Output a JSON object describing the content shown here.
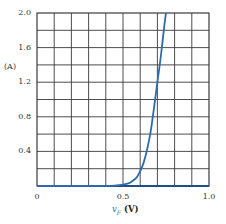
{
  "chart_data": {
    "type": "line",
    "title": "",
    "xlabel": "v_F (V)",
    "xlabel_var": "v",
    "xlabel_sub": "F",
    "xlabel_unit": "(V)",
    "ylabel": "(A)",
    "xlim": [
      0,
      1.0
    ],
    "ylim": [
      0,
      2.0
    ],
    "grid": true,
    "grid_divisions": {
      "x": 10,
      "y": 10
    },
    "x_ticks": [
      {
        "value": 0,
        "label": "0"
      },
      {
        "value": 0.5,
        "label": "0.5"
      },
      {
        "value": 1.0,
        "label": "1.0"
      }
    ],
    "y_ticks": [
      {
        "value": 0.4,
        "label": "0.4"
      },
      {
        "value": 0.8,
        "label": "0.8"
      },
      {
        "value": 1.2,
        "label": "1.2"
      },
      {
        "value": 1.6,
        "label": "1.6"
      },
      {
        "value": 2.0,
        "label": "2.0"
      }
    ],
    "series": [
      {
        "name": "diode forward current",
        "color": "#2e6ab0",
        "x": [
          0,
          0.3,
          0.4,
          0.45,
          0.5,
          0.53,
          0.55,
          0.58,
          0.6,
          0.62,
          0.64,
          0.66,
          0.68,
          0.7,
          0.72,
          0.74,
          0.75
        ],
        "y": [
          0,
          0,
          0.002,
          0.005,
          0.015,
          0.03,
          0.05,
          0.1,
          0.17,
          0.27,
          0.42,
          0.62,
          0.9,
          1.2,
          1.5,
          1.85,
          2.0
        ]
      }
    ]
  },
  "colors": {
    "curve": "#2e6ab0",
    "grid": "#3a3a3a",
    "axis": "#222222"
  }
}
